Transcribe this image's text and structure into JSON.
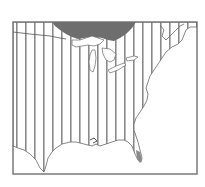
{
  "map": {
    "region": "Eastern United States",
    "projection_hint": "map with vertical hatching lines over the land area",
    "colors": {
      "background": "#ffffff",
      "frame": "#707070",
      "hatch": "#8a8a8a",
      "coast": "#6a6a6a",
      "canada_shaded": "#6e6e6e",
      "florida_tip": "#8a8a8a"
    },
    "frame": {
      "x": 13,
      "y": 22,
      "width": 184,
      "height": 152
    },
    "hatch": {
      "orientation": "vertical",
      "spacing_px": 9,
      "x_start": 16,
      "x_end": 194
    },
    "features": [
      {
        "name": "canada-shaded-area",
        "description": "dark shaded region at top-center above Great Lakes"
      },
      {
        "name": "great-lakes",
        "description": "white lake shapes at north-center"
      },
      {
        "name": "atlantic-coastline",
        "description": "coastline running from northeast down to Florida"
      },
      {
        "name": "gulf-coastline",
        "description": "coastline along bottom from Texas to Florida"
      },
      {
        "name": "border-line",
        "description": "thin US–Canada border at upper-left"
      }
    ]
  }
}
